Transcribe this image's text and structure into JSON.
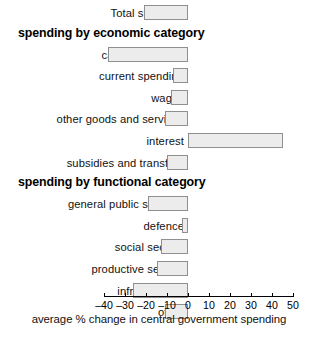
{
  "chart_data": {
    "type": "bar",
    "orientation": "horizontal",
    "title": "",
    "xlabel": "average % change in central government spending",
    "ylabel": "",
    "xlim": [
      -40,
      50
    ],
    "xticks": [
      -40,
      -30,
      -20,
      -10,
      0,
      10,
      20,
      30,
      40,
      50
    ],
    "xticklabels": [
      "–40",
      "–30",
      "–20",
      "–10",
      "0",
      "10",
      "20",
      "30",
      "40",
      "50"
    ],
    "grid": false,
    "legend": false,
    "zero_line": 0,
    "bar_fill_color": "#ececec",
    "bar_edge_color": "#8f8f8f",
    "sections": [
      {
        "heading": "",
        "heading_visible": false,
        "items": [
          {
            "label": "Total spending",
            "value": -21
          }
        ]
      },
      {
        "heading": "spending by economic category",
        "heading_visible": true,
        "items": [
          {
            "label": "capital spending",
            "value": -38
          },
          {
            "label": "current spending",
            "value": -7
          },
          {
            "label": "wages",
            "value": -8
          },
          {
            "label": "other goods and services",
            "value": -11
          },
          {
            "label": "interest",
            "value": 45
          },
          {
            "label": "subsidies and transfers",
            "value": -10
          }
        ]
      },
      {
        "heading": "spending by functional category",
        "heading_visible": true,
        "items": [
          {
            "label": "general public services",
            "value": -19
          },
          {
            "label": "defence",
            "value": -3
          },
          {
            "label": "social sectors",
            "value": -13
          },
          {
            "label": "productive sectors",
            "value": -15
          },
          {
            "label": "infrastructure",
            "value": -26
          },
          {
            "label": "other",
            "value": -11
          }
        ]
      }
    ],
    "categories": [
      "Total spending",
      "capital spending",
      "current spending",
      "wages",
      "other goods and services",
      "interest",
      "subsidies and transfers",
      "general public services",
      "defence",
      "social sectors",
      "productive sectors",
      "infrastructure",
      "other"
    ],
    "values": [
      -21,
      -38,
      -7,
      -8,
      -11,
      45,
      -10,
      -19,
      -3,
      -13,
      -15,
      -26,
      -11
    ]
  },
  "layout": {
    "zero_px": 188,
    "px_per_unit": 2.1,
    "label_right_px": 184,
    "rows": [
      {
        "kind": "bar",
        "index": 0,
        "top": 2
      },
      {
        "kind": "heading",
        "index": 1,
        "top": 30
      },
      {
        "kind": "bar",
        "index": 1,
        "top": 49
      },
      {
        "kind": "bar",
        "index": 2,
        "top": 71
      },
      {
        "kind": "bar",
        "index": 3,
        "top": 93
      },
      {
        "kind": "bar",
        "index": 4,
        "top": 113
      },
      {
        "kind": "bar",
        "index": 5,
        "top": 124
      },
      {
        "kind": "bar",
        "index": 6,
        "top": 143
      },
      {
        "kind": "heading",
        "index": 2,
        "top": 170
      },
      {
        "kind": "bar",
        "index": 7,
        "top": 187
      },
      {
        "kind": "bar",
        "index": 8,
        "top": 209
      },
      {
        "kind": "bar",
        "index": 9,
        "top": 230
      },
      {
        "kind": "bar",
        "index": 10,
        "top": 251
      },
      {
        "kind": "bar",
        "index": 11,
        "top": 256
      },
      {
        "kind": "bar",
        "index": 12,
        "top": 272
      }
    ]
  }
}
